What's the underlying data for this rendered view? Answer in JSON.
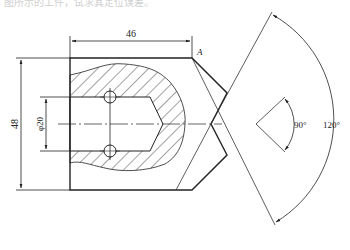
{
  "caption": "图所示的工件，试求其定位误差。",
  "drawing": {
    "stroke_color": "#222222",
    "hatch_color": "#333333",
    "dimensions": {
      "length": "46",
      "height": "48",
      "bore_diameter": "φ20",
      "inner_angle": "90°",
      "outer_angle": "120°"
    },
    "labels": {
      "datum": "A"
    }
  }
}
